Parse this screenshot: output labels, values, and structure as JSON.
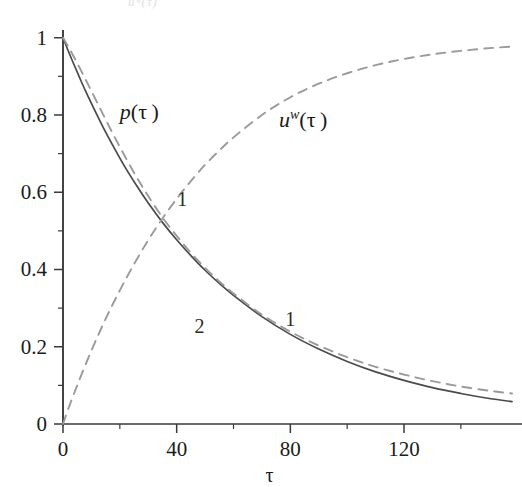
{
  "figure": {
    "top_caption": "uʷ(τ)",
    "background_color": "#ffffff",
    "axis_color": "#3a3a3a",
    "solid_curve_color": "#4a4a4a",
    "dashed_curve_color": "#9a9a9a"
  },
  "labels": {
    "p_label": "p",
    "p_label_arg": "(τ )",
    "u_label": "u",
    "u_label_sup": "w",
    "u_label_arg": "(τ )",
    "curve_one_upper": "1",
    "curve_one_lower": "1",
    "curve_two": "2"
  },
  "chart_data": {
    "type": "line",
    "title": "",
    "xlabel": "τ",
    "ylabel": "",
    "xlim": [
      0,
      158
    ],
    "ylim": [
      0,
      1.02
    ],
    "xticks": [
      0,
      40,
      80,
      120
    ],
    "xticklabels": [
      "0",
      "40",
      "80",
      "120"
    ],
    "xminorticks": [
      20,
      60,
      100,
      140
    ],
    "yticks": [
      0,
      0.2,
      0.4,
      0.6,
      0.8,
      1
    ],
    "yticklabels": [
      "0",
      "0.2",
      "0.4",
      "0.6",
      "0.8",
      "1"
    ],
    "yminorticks": [
      0.1,
      0.3,
      0.5,
      0.7,
      0.9
    ],
    "grid": false,
    "legend": "none",
    "annotations": [
      {
        "text": "p(τ)",
        "x": 20,
        "y": 0.79
      },
      {
        "text": "uᵂ(τ)",
        "x": 76,
        "y": 0.77
      },
      {
        "text": "1",
        "x": 42,
        "y": 0.565
      },
      {
        "text": "2",
        "x": 48,
        "y": 0.235
      },
      {
        "text": "1",
        "x": 80,
        "y": 0.255
      }
    ],
    "series": [
      {
        "name": "p(τ) curve 2",
        "style": "solid",
        "color": "#4a4a4a",
        "x": [
          0,
          2,
          4,
          6,
          8,
          10,
          14,
          18,
          22,
          26,
          30,
          35,
          40,
          45,
          50,
          55,
          60,
          70,
          80,
          90,
          100,
          110,
          120,
          130,
          140,
          150,
          158
        ],
        "y": [
          1.0,
          0.963,
          0.928,
          0.894,
          0.861,
          0.83,
          0.77,
          0.715,
          0.663,
          0.616,
          0.572,
          0.522,
          0.477,
          0.436,
          0.398,
          0.364,
          0.333,
          0.278,
          0.232,
          0.194,
          0.162,
          0.135,
          0.113,
          0.094,
          0.079,
          0.066,
          0.058
        ]
      },
      {
        "name": "p(τ) curve 1",
        "style": "dashed",
        "color": "#9a9a9a",
        "x": [
          0,
          2,
          4,
          6,
          8,
          10,
          14,
          18,
          22,
          26,
          30,
          35,
          40,
          45,
          50,
          55,
          60,
          70,
          80,
          90,
          100,
          110,
          120,
          130,
          140,
          150,
          158
        ],
        "y": [
          1.0,
          0.975,
          0.948,
          0.92,
          0.891,
          0.862,
          0.803,
          0.745,
          0.69,
          0.638,
          0.59,
          0.535,
          0.487,
          0.443,
          0.404,
          0.369,
          0.338,
          0.283,
          0.239,
          0.203,
          0.173,
          0.148,
          0.128,
          0.111,
          0.097,
          0.086,
          0.079
        ]
      },
      {
        "name": "uᵂ(τ)",
        "style": "dashed",
        "color": "#9a9a9a",
        "x": [
          0,
          2,
          5,
          10,
          15,
          20,
          25,
          30,
          35,
          40,
          45,
          50,
          55,
          60,
          70,
          80,
          90,
          100,
          110,
          120,
          130,
          140,
          150,
          158
        ],
        "y": [
          0.0,
          0.042,
          0.1,
          0.19,
          0.272,
          0.346,
          0.414,
          0.476,
          0.532,
          0.583,
          0.629,
          0.671,
          0.708,
          0.742,
          0.8,
          0.846,
          0.881,
          0.908,
          0.929,
          0.945,
          0.957,
          0.966,
          0.973,
          0.977
        ]
      }
    ]
  }
}
